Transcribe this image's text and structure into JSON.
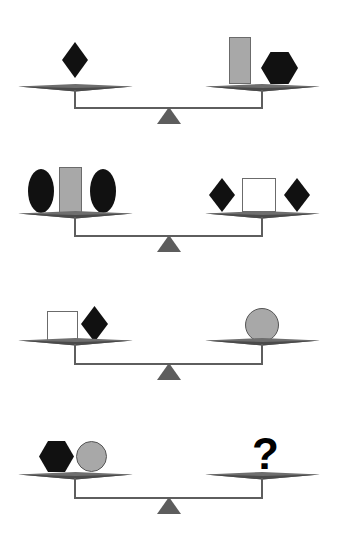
{
  "puzzle": {
    "title": "Balance scale weight puzzle",
    "type": "balance-scale-reasoning",
    "canvas": {
      "width": 340,
      "height": 553,
      "background": "#ffffff"
    },
    "colors": {
      "shape_black": "#111111",
      "shape_gray": "#a8a8a8",
      "shape_white": "#ffffff",
      "shape_outline": "#6b6b6b",
      "beam": "#6e6e6e",
      "beam_dark": "#4a4a4a",
      "fulcrum": "#5d5d5d",
      "stem": "#5e5e5e",
      "question_mark": "#000000"
    },
    "scales": [
      {
        "index": 1,
        "state": "balanced",
        "left_pan": {
          "label": "left-pan",
          "items": [
            {
              "shape": "diamond",
              "fill": "black",
              "width": 26,
              "height": 36
            }
          ]
        },
        "right_pan": {
          "label": "right-pan",
          "items": [
            {
              "shape": "rectangle",
              "fill": "gray",
              "width": 22,
              "height": 47
            },
            {
              "shape": "hexagon",
              "fill": "black",
              "width": 37,
              "height": 32
            }
          ]
        }
      },
      {
        "index": 2,
        "state": "balanced",
        "left_pan": {
          "label": "left-pan",
          "items": [
            {
              "shape": "ellipse",
              "fill": "black",
              "width": 26,
              "height": 44
            },
            {
              "shape": "rectangle",
              "fill": "gray",
              "width": 23,
              "height": 46
            },
            {
              "shape": "ellipse",
              "fill": "black",
              "width": 26,
              "height": 44
            }
          ]
        },
        "right_pan": {
          "label": "right-pan",
          "items": [
            {
              "shape": "diamond",
              "fill": "black",
              "width": 26,
              "height": 34
            },
            {
              "shape": "square",
              "fill": "white",
              "width": 34,
              "height": 34
            },
            {
              "shape": "diamond",
              "fill": "black",
              "width": 26,
              "height": 34
            }
          ]
        }
      },
      {
        "index": 3,
        "state": "balanced",
        "left_pan": {
          "label": "left-pan",
          "items": [
            {
              "shape": "square",
              "fill": "white",
              "width": 31,
              "height": 31
            },
            {
              "shape": "diamond",
              "fill": "black",
              "width": 27,
              "height": 36
            }
          ]
        },
        "right_pan": {
          "label": "right-pan",
          "items": [
            {
              "shape": "circle",
              "fill": "gray",
              "width": 34,
              "height": 34
            }
          ]
        }
      },
      {
        "index": 4,
        "state": "balanced",
        "left_pan": {
          "label": "left-pan",
          "items": [
            {
              "shape": "hexagon",
              "fill": "black",
              "width": 35,
              "height": 31
            },
            {
              "shape": "circle",
              "fill": "gray",
              "width": 31,
              "height": 31
            }
          ]
        },
        "right_pan": {
          "label": "right-pan",
          "items": [
            {
              "shape": "question-mark",
              "fill": "black",
              "text": "?",
              "width": 24,
              "height": 36
            }
          ]
        }
      }
    ],
    "answer_prompt": "?"
  }
}
